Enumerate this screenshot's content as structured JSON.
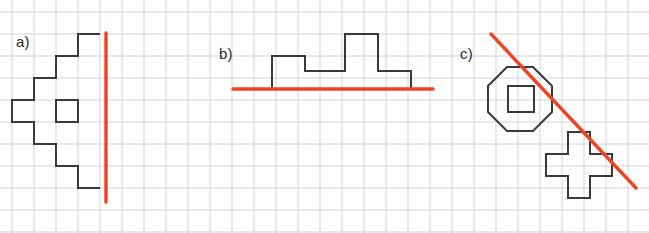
{
  "figure": {
    "title": "",
    "background_color": "#ffffff",
    "width": 649,
    "height": 233,
    "grid": {
      "cell_size": 22,
      "origin_x": 12,
      "origin_y": 12,
      "line_color": "#c9cfe0",
      "line_width": 0.9,
      "columns": 29,
      "rows": 10
    },
    "ink_color": "#3a3a3a",
    "accent_color": "#ef4423",
    "shape_stroke_width": 2.0,
    "line_stroke_width": 3.4
  },
  "panels": [
    {
      "id": "a",
      "label": "a)",
      "label_x": 16,
      "label_y": 33,
      "shape_name": "stepped-arrow-with-hole",
      "outline_points": "100,34 78,34 78,56 56,56 56,78 34,78 34,100 12,100 12,122 34,122 34,144 56,144 56,166 78,166 78,188 100,188",
      "hole_rect": {
        "x": 56,
        "y": 100,
        "width": 22,
        "height": 22
      },
      "red_line": {
        "orientation": "vertical",
        "x1": 106,
        "y1": 33,
        "x2": 106,
        "y2": 202
      }
    },
    {
      "id": "b",
      "label": "b)",
      "label_x": 219,
      "label_y": 45,
      "shape_name": "skyline-step-profile",
      "outline_points": "272,89 272,56 305,56 305,71 345,71 345,34 378,34 378,71 411,71 411,89",
      "hole_rect": null,
      "red_line": {
        "orientation": "horizontal",
        "x1": 233,
        "y1": 89,
        "x2": 433,
        "y2": 89
      }
    },
    {
      "id": "c",
      "label": "c)",
      "label_x": 460,
      "label_y": 45,
      "shape_name": "octagon-with-square-hole-and-plus",
      "octagon_points": "507,67 533,67 552,86 552,112 533,131 507,131 488,112 488,86",
      "hole_rect": {
        "x": 508,
        "y": 86,
        "width": 26,
        "height": 26
      },
      "plus_points": "568,132 590,132 590,154 612,154 612,176 590,176 590,198 568,198 568,176 546,176 546,154 568,154",
      "red_line": {
        "orientation": "diagonal",
        "x1": 491,
        "y1": 34,
        "x2": 636,
        "y2": 188
      }
    }
  ]
}
